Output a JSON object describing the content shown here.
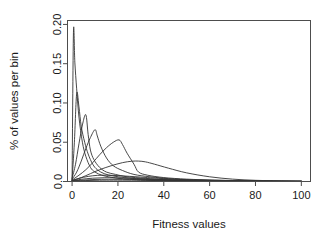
{
  "chart_data": {
    "type": "line",
    "title": "",
    "xlabel": "Fitness values",
    "ylabel": "% of values per bin",
    "xlim": [
      -2,
      104
    ],
    "ylim": [
      0.0,
      0.205
    ],
    "xticks": [
      0,
      20,
      40,
      60,
      80,
      100
    ],
    "xticklabels": [
      "0",
      "20",
      "40",
      "60",
      "80",
      "100"
    ],
    "yticks": [
      0.0,
      0.05,
      0.1,
      0.15,
      0.2
    ],
    "yticklabels": [
      "0.0",
      "0.05",
      "0.10",
      "0.15",
      "0.20"
    ],
    "grid": false,
    "legend": "none",
    "line_color": "#333333",
    "frame_color": "#4d4d4d",
    "background": "#ffffff",
    "series": [
      {
        "name": "generation-1",
        "x": [
          0,
          0.6,
          1.2,
          2,
          3,
          4.5,
          6,
          8,
          10,
          13,
          16,
          20,
          25,
          30,
          40,
          55,
          70,
          85,
          100
        ],
        "values": [
          0.0,
          0.19,
          0.152,
          0.118,
          0.082,
          0.05,
          0.032,
          0.018,
          0.012,
          0.008,
          0.006,
          0.004,
          0.003,
          0.002,
          0.001,
          0.0008,
          0.0005,
          0.0003,
          0.0002
        ]
      },
      {
        "name": "generation-2",
        "x": [
          0,
          1,
          2,
          3,
          4,
          5.5,
          7,
          9,
          11,
          14,
          18,
          23,
          30,
          40,
          55,
          70,
          85,
          100
        ],
        "values": [
          0.002,
          0.05,
          0.112,
          0.095,
          0.07,
          0.05,
          0.035,
          0.022,
          0.015,
          0.01,
          0.007,
          0.005,
          0.003,
          0.002,
          0.001,
          0.0006,
          0.0004,
          0.0002
        ]
      },
      {
        "name": "generation-3",
        "x": [
          0,
          1.5,
          3,
          4.5,
          6,
          7,
          8,
          9.5,
          12,
          15,
          19,
          24,
          32,
          42,
          55,
          70,
          85,
          100
        ],
        "values": [
          0.004,
          0.022,
          0.048,
          0.072,
          0.085,
          0.06,
          0.04,
          0.028,
          0.018,
          0.012,
          0.009,
          0.006,
          0.004,
          0.002,
          0.0012,
          0.0008,
          0.0004,
          0.0002
        ]
      },
      {
        "name": "generation-4",
        "x": [
          0,
          2,
          4,
          6,
          8,
          10,
          11,
          12.5,
          15,
          18,
          22,
          27,
          34,
          45,
          58,
          72,
          86,
          100
        ],
        "values": [
          0.003,
          0.012,
          0.026,
          0.042,
          0.056,
          0.066,
          0.058,
          0.045,
          0.03,
          0.02,
          0.014,
          0.009,
          0.006,
          0.003,
          0.0018,
          0.001,
          0.0005,
          0.0002
        ]
      },
      {
        "name": "generation-5",
        "x": [
          0,
          3,
          6,
          9,
          12,
          15,
          18,
          20.5,
          22,
          24,
          27,
          29,
          33,
          40,
          50,
          62,
          75,
          88,
          100
        ],
        "values": [
          0.002,
          0.008,
          0.015,
          0.024,
          0.034,
          0.043,
          0.05,
          0.053,
          0.047,
          0.036,
          0.022,
          0.012,
          0.008,
          0.005,
          0.003,
          0.0018,
          0.001,
          0.0005,
          0.0002
        ]
      },
      {
        "name": "generation-6",
        "x": [
          0,
          4,
          8,
          12,
          17,
          22,
          26,
          29,
          32,
          36,
          42,
          50,
          60,
          70,
          80,
          90,
          100
        ],
        "values": [
          0.001,
          0.005,
          0.01,
          0.015,
          0.02,
          0.024,
          0.0258,
          0.026,
          0.025,
          0.022,
          0.017,
          0.011,
          0.006,
          0.003,
          0.0015,
          0.0007,
          0.0003
        ]
      },
      {
        "name": "generation-7",
        "x": [
          0,
          3,
          7,
          11,
          15,
          20,
          25,
          30,
          36,
          44,
          54,
          64,
          74,
          84,
          94,
          100
        ],
        "values": [
          0.0015,
          0.004,
          0.0065,
          0.0078,
          0.008,
          0.0075,
          0.0066,
          0.0056,
          0.0044,
          0.003,
          0.0018,
          0.001,
          0.0006,
          0.0003,
          0.0002,
          0.0001
        ]
      },
      {
        "name": "generation-8",
        "x": [
          0,
          4,
          9,
          14,
          19,
          25,
          31,
          38,
          46,
          56,
          66,
          76,
          86,
          96,
          100
        ],
        "values": [
          0.001,
          0.0028,
          0.0042,
          0.0048,
          0.0047,
          0.0042,
          0.0035,
          0.0027,
          0.0019,
          0.0012,
          0.0007,
          0.0004,
          0.0002,
          0.0001,
          0.0001
        ]
      },
      {
        "name": "generation-9",
        "x": [
          0,
          5,
          10,
          16,
          22,
          28,
          35,
          43,
          52,
          62,
          72,
          82,
          92,
          100
        ],
        "values": [
          0.0008,
          0.0018,
          0.0026,
          0.0029,
          0.0028,
          0.0025,
          0.0021,
          0.0016,
          0.0011,
          0.0007,
          0.0004,
          0.0002,
          0.0001,
          0.0001
        ]
      },
      {
        "name": "generation-10",
        "x": [
          0,
          6,
          12,
          18,
          26,
          34,
          44,
          54,
          66,
          78,
          90,
          100
        ],
        "values": [
          0.0006,
          0.0012,
          0.0016,
          0.0017,
          0.0016,
          0.0013,
          0.001,
          0.0007,
          0.0004,
          0.0002,
          0.0001,
          0.0001
        ]
      }
    ]
  }
}
